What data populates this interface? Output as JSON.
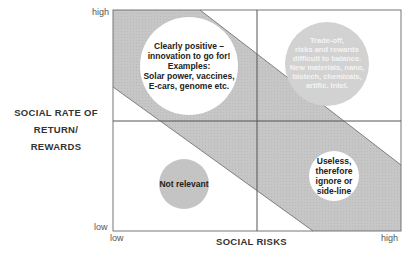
{
  "diagram": {
    "y_axis": {
      "title_line1": "SOCIAL RATE OF",
      "title_line2": "RETURN/ REWARDS",
      "high": "high",
      "low": "low"
    },
    "x_axis": {
      "title": "SOCIAL RISKS",
      "low": "low",
      "high": "high"
    },
    "quadrants": {
      "top_left": {
        "lines": [
          "Clearly positive –",
          "innovation to go for!",
          "Examples:",
          "Solar power, vaccines,",
          "E-cars, genome etc."
        ]
      },
      "top_right": {
        "lines": [
          "Trade-off,",
          "risks and rewards",
          "difficult to balance.",
          "New materials, nano,",
          "biotech, chemicals,",
          "artific. Intel."
        ]
      },
      "bottom_left": {
        "lines": [
          "Not relevant"
        ]
      },
      "bottom_right": {
        "lines": [
          "Useless,",
          "therefore",
          "ignore or",
          "side-line"
        ]
      }
    },
    "colors": {
      "band": "#c4c4c4",
      "frame": "#777777",
      "bubble_white": "#ffffff",
      "bubble_grey": "#c8c8c8"
    }
  }
}
